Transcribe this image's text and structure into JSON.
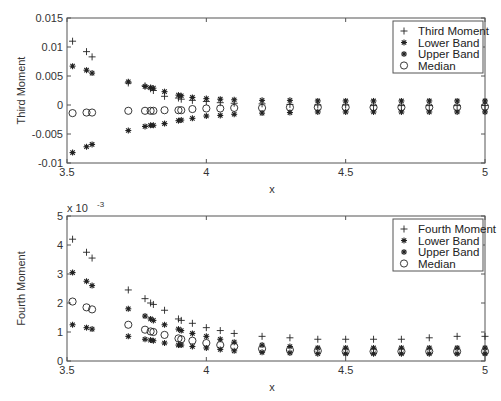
{
  "chart_data": [
    {
      "type": "scatter",
      "title": "",
      "xlabel": "x",
      "ylabel": "Third Moment",
      "xlim": [
        3.5,
        5
      ],
      "ylim": [
        -0.01,
        0.015
      ],
      "xticks": [
        "3.5",
        "4",
        "4.5",
        "5"
      ],
      "yticks": [
        "-0.01",
        "-0.005",
        "0",
        "0.005",
        "0.01",
        "0.015"
      ],
      "grid": false,
      "legend_position": "upper right",
      "series": [
        {
          "name": "Third Moment",
          "marker": "+",
          "x": [
            3.52,
            3.57,
            3.59,
            3.72,
            3.78,
            3.8,
            3.81,
            3.85,
            3.9,
            3.91,
            3.95,
            4.0,
            4.05,
            4.1,
            4.2,
            4.3,
            4.4,
            4.5,
            4.6,
            4.7,
            4.8,
            4.9,
            5.0
          ],
          "y": [
            0.011,
            0.0092,
            0.0083,
            0.0038,
            0.0033,
            0.0028,
            0.0025,
            0.0015,
            0.0012,
            0.001,
            0.0008,
            0.0006,
            0.0004,
            0.0003,
            0.0002,
            0.0001,
            0.0,
            0.0,
            -0.0001,
            -0.0001,
            -0.0001,
            -0.0001,
            -0.0001
          ]
        },
        {
          "name": "Lower Band",
          "marker": "*",
          "x": [
            3.52,
            3.57,
            3.59,
            3.72,
            3.78,
            3.8,
            3.81,
            3.85,
            3.9,
            3.91,
            3.95,
            4.0,
            4.05,
            4.1,
            4.2,
            4.3,
            4.4,
            4.5,
            4.6,
            4.7,
            4.8,
            4.9,
            5.0
          ],
          "y": [
            -0.0082,
            -0.0072,
            -0.0068,
            -0.0044,
            -0.0037,
            -0.0035,
            -0.0035,
            -0.0032,
            -0.0027,
            -0.0026,
            -0.0023,
            -0.0019,
            -0.0018,
            -0.0016,
            -0.0014,
            -0.0013,
            -0.0012,
            -0.0012,
            -0.0012,
            -0.0012,
            -0.0012,
            -0.0012,
            -0.0012
          ]
        },
        {
          "name": "Upper Band",
          "marker": "*",
          "x": [
            3.52,
            3.57,
            3.59,
            3.72,
            3.78,
            3.8,
            3.81,
            3.85,
            3.9,
            3.91,
            3.95,
            4.0,
            4.05,
            4.1,
            4.2,
            4.3,
            4.4,
            4.5,
            4.6,
            4.7,
            4.8,
            4.9,
            5.0
          ],
          "y": [
            0.0067,
            0.006,
            0.0055,
            0.004,
            0.0032,
            0.003,
            0.0029,
            0.0023,
            0.0017,
            0.0016,
            0.0013,
            0.0011,
            0.001,
            0.0009,
            0.0008,
            0.0008,
            0.0007,
            0.0007,
            0.0007,
            0.0007,
            0.0007,
            0.0007,
            0.0007
          ]
        },
        {
          "name": "Median",
          "marker": "o",
          "x": [
            3.52,
            3.57,
            3.59,
            3.72,
            3.78,
            3.8,
            3.81,
            3.85,
            3.9,
            3.91,
            3.95,
            4.0,
            4.05,
            4.1,
            4.2,
            4.3,
            4.4,
            4.5,
            4.6,
            4.7,
            4.8,
            4.9,
            5.0
          ],
          "y": [
            -0.0014,
            -0.0013,
            -0.0013,
            -0.001,
            -0.001,
            -0.001,
            -0.001,
            -0.0009,
            -0.0009,
            -0.0009,
            -0.0007,
            -0.0006,
            -0.0006,
            -0.0005,
            -0.0005,
            -0.0004,
            -0.0004,
            -0.0004,
            -0.0004,
            -0.0004,
            -0.0004,
            -0.0004,
            -0.0003
          ]
        }
      ]
    },
    {
      "type": "scatter",
      "title": "",
      "xlabel": "x",
      "ylabel": "Fourth Moment",
      "y_multiplier": "x 10^-3",
      "xlim": [
        3.5,
        5
      ],
      "ylim": [
        0,
        5
      ],
      "xticks": [
        "3.5",
        "4",
        "4.5",
        "5"
      ],
      "yticks": [
        "0",
        "1",
        "2",
        "3",
        "4",
        "5"
      ],
      "grid": false,
      "legend_position": "upper right",
      "series": [
        {
          "name": "Fourth Moment",
          "marker": "+",
          "x": [
            3.52,
            3.57,
            3.59,
            3.72,
            3.78,
            3.8,
            3.81,
            3.85,
            3.9,
            3.91,
            3.95,
            4.0,
            4.05,
            4.1,
            4.2,
            4.3,
            4.4,
            4.5,
            4.6,
            4.7,
            4.8,
            4.9,
            5.0
          ],
          "y": [
            4.2,
            3.75,
            3.55,
            2.45,
            2.15,
            2.0,
            1.95,
            1.75,
            1.45,
            1.4,
            1.3,
            1.15,
            1.05,
            0.95,
            0.85,
            0.8,
            0.75,
            0.75,
            0.75,
            0.75,
            0.8,
            0.85,
            0.85
          ]
        },
        {
          "name": "Lower Band",
          "marker": "*",
          "x": [
            3.52,
            3.57,
            3.59,
            3.72,
            3.78,
            3.8,
            3.81,
            3.85,
            3.9,
            3.91,
            3.95,
            4.0,
            4.05,
            4.1,
            4.2,
            4.3,
            4.4,
            4.5,
            4.6,
            4.7,
            4.8,
            4.9,
            5.0
          ],
          "y": [
            1.25,
            1.15,
            1.1,
            0.85,
            0.75,
            0.72,
            0.7,
            0.62,
            0.55,
            0.55,
            0.5,
            0.45,
            0.4,
            0.35,
            0.3,
            0.28,
            0.25,
            0.25,
            0.25,
            0.25,
            0.25,
            0.25,
            0.25
          ]
        },
        {
          "name": "Upper Band",
          "marker": "*",
          "x": [
            3.52,
            3.57,
            3.59,
            3.72,
            3.78,
            3.8,
            3.81,
            3.85,
            3.9,
            3.91,
            3.95,
            4.0,
            4.05,
            4.1,
            4.2,
            4.3,
            4.4,
            4.5,
            4.6,
            4.7,
            4.8,
            4.9,
            5.0
          ],
          "y": [
            3.05,
            2.75,
            2.6,
            1.8,
            1.55,
            1.45,
            1.4,
            1.25,
            1.1,
            1.05,
            0.95,
            0.85,
            0.75,
            0.65,
            0.55,
            0.5,
            0.45,
            0.45,
            0.45,
            0.45,
            0.45,
            0.45,
            0.45
          ]
        },
        {
          "name": "Median",
          "marker": "o",
          "x": [
            3.52,
            3.57,
            3.59,
            3.72,
            3.78,
            3.8,
            3.81,
            3.85,
            3.9,
            3.91,
            3.95,
            4.0,
            4.05,
            4.1,
            4.2,
            4.3,
            4.4,
            4.5,
            4.6,
            4.7,
            4.8,
            4.9,
            5.0
          ],
          "y": [
            2.05,
            1.85,
            1.78,
            1.25,
            1.08,
            1.02,
            1.0,
            0.9,
            0.78,
            0.75,
            0.7,
            0.62,
            0.55,
            0.5,
            0.42,
            0.38,
            0.35,
            0.33,
            0.33,
            0.33,
            0.33,
            0.33,
            0.33
          ]
        }
      ]
    }
  ],
  "plots": [
    {
      "ylabel": "Third Moment",
      "xlabel": "x",
      "multiplier": "",
      "legend": [
        "Third Moment",
        "Lower Band",
        "Upper Band",
        "Median"
      ]
    },
    {
      "ylabel": "Fourth Moment",
      "xlabel": "x",
      "multiplier": "x 10",
      "multiplier_exp": "-3",
      "legend": [
        "Fourth Moment",
        "Lower Band",
        "Upper Band",
        "Median"
      ]
    }
  ]
}
